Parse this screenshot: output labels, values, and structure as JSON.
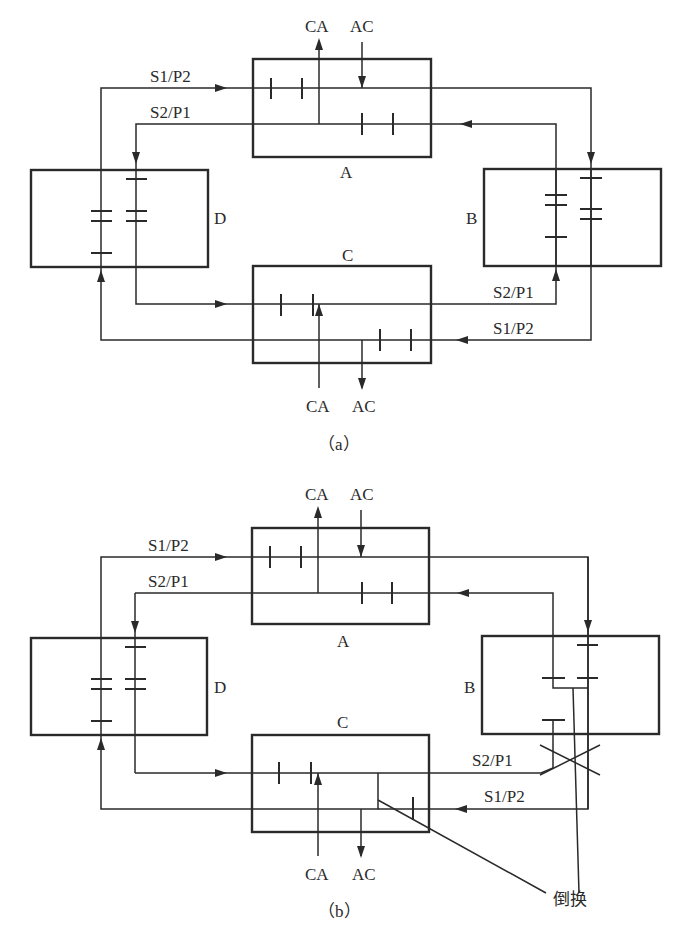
{
  "figure": {
    "panels": [
      {
        "id": "a",
        "caption": "（a）",
        "nodes": {
          "A": "A",
          "B": "B",
          "C": "C",
          "D": "D"
        },
        "line_labels": {
          "top_outer": "S1/P2",
          "top_inner": "S2/P1",
          "bottom_inner": "S2/P1",
          "bottom_outer": "S1/P2"
        },
        "ports": {
          "A_out": "CA",
          "A_in": "AC",
          "C_in": "CA",
          "C_out": "AC"
        }
      },
      {
        "id": "b",
        "caption": "（b）",
        "nodes": {
          "A": "A",
          "B": "B",
          "C": "C",
          "D": "D"
        },
        "line_labels": {
          "top_outer": "S1/P2",
          "top_inner": "S2/P1",
          "bottom_inner": "S2/P1",
          "bottom_outer": "S1/P2"
        },
        "ports": {
          "A_out": "CA",
          "A_in": "AC",
          "C_in": "CA",
          "C_out": "AC"
        },
        "annotation": "倒换"
      }
    ]
  }
}
